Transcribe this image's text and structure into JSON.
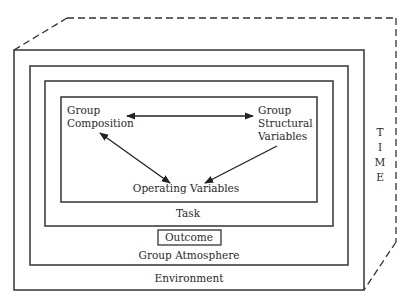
{
  "diagram": {
    "layers": [
      {
        "id": "environment",
        "label": "Environment"
      },
      {
        "id": "group_atmosphere",
        "label": "Group Atmosphere"
      },
      {
        "id": "task",
        "label": "Task"
      },
      {
        "id": "inner",
        "label": ""
      }
    ],
    "outcome": {
      "label": "Outcome"
    },
    "time": {
      "letters": [
        "T",
        "I",
        "M",
        "E"
      ]
    },
    "nodes": {
      "group_composition": {
        "line1": "Group",
        "line2": "Composition"
      },
      "group_structural": {
        "line1": "Group",
        "line2": "Structural",
        "line3": "Variables"
      },
      "operating": {
        "label": "Operating Variables"
      }
    },
    "edges": [
      {
        "from": "Group Composition",
        "to": "Group Structural Variables",
        "type": "bidirectional"
      },
      {
        "from": "Group Composition",
        "to": "Operating Variables",
        "type": "bidirectional"
      },
      {
        "from": "Group Structural Variables",
        "to": "Operating Variables",
        "type": "directed"
      }
    ],
    "colors": {
      "line": "#333333",
      "background": "#ffffff"
    }
  }
}
